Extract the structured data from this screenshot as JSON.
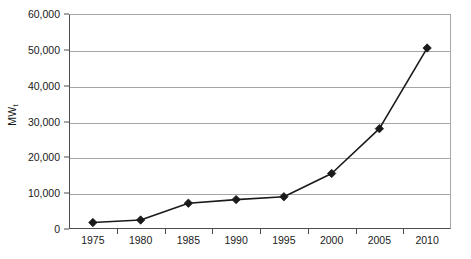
{
  "chart_data": {
    "type": "line",
    "title": "",
    "subtitle": "",
    "xlabel": "",
    "ylabel": "MW",
    "ylabel_subscript": "t",
    "categories": [
      "1975",
      "1980",
      "1985",
      "1990",
      "1995",
      "2000",
      "2005",
      "2010"
    ],
    "x": [
      1975,
      1980,
      1985,
      1990,
      1995,
      2000,
      2005,
      2010
    ],
    "values": [
      1800,
      2500,
      7200,
      8200,
      9000,
      15500,
      28000,
      50500
    ],
    "series": [
      {
        "name": "",
        "values": [
          1800,
          2500,
          7200,
          8200,
          9000,
          15500,
          28000,
          50500
        ]
      }
    ],
    "ylim": [
      0,
      60000
    ],
    "y_ticks": [
      0,
      10000,
      20000,
      30000,
      40000,
      50000,
      60000
    ],
    "y_tick_labels": [
      "0",
      "10,000",
      "20,000",
      "30,000",
      "40,000",
      "50,000",
      "60,000"
    ],
    "grid": true,
    "grid_axis": "y",
    "legend": false,
    "legend_position": "none",
    "marker": "diamond",
    "line_color": "#1a1a1a",
    "marker_color": "#1a1a1a",
    "grid_color": "#a6a6a6",
    "axis_color": "#4d4d4d",
    "background_color": "#ffffff"
  }
}
